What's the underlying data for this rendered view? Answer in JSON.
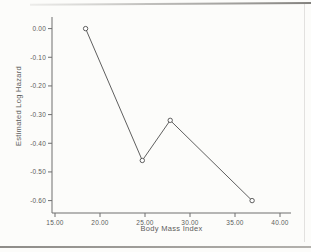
{
  "chart_data": {
    "type": "line",
    "title": "",
    "xlabel": "Body Mass Index",
    "ylabel": "Estimated Log Hazard",
    "series": [
      {
        "name": "estimated-log-hazard-vs-bmi",
        "x": [
          18.4,
          24.7,
          27.8,
          36.9
        ],
        "y": [
          0.0,
          -0.46,
          -0.32,
          -0.6
        ]
      }
    ],
    "xlim": [
      15,
      40
    ],
    "ylim": [
      -0.6,
      0.0
    ],
    "x_tick_values": [
      15,
      20,
      25,
      30,
      35,
      40
    ],
    "x_tick_labels": [
      "15.00",
      "20.00",
      "25.00",
      "30.00",
      "35.00",
      "40.00"
    ],
    "y_tick_values": [
      0.0,
      -0.1,
      -0.2,
      -0.3,
      -0.4,
      -0.5,
      -0.6
    ],
    "y_tick_labels": [
      "0.00",
      "-0.10",
      "-0.20",
      "-0.30",
      "-0.40",
      "-0.50",
      "-0.60"
    ],
    "grid": false,
    "legend": "none",
    "marker": "open-circle",
    "colors": {
      "line": "#4d4d4d",
      "marker_fill": "#ffffff",
      "marker_stroke": "#4d4d4d",
      "axis": "#6e6e6e",
      "text": "#5c5c5c",
      "background": "#fcfcfa",
      "page_rule": "#96948f"
    }
  }
}
